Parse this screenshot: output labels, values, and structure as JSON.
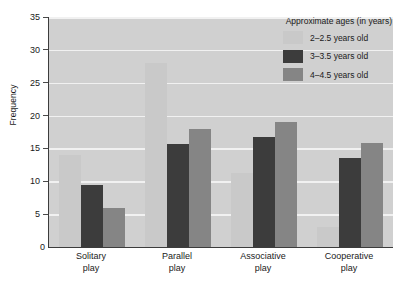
{
  "chart_data": {
    "type": "bar",
    "title": "",
    "xlabel": "",
    "ylabel": "Frequency",
    "ylim": [
      0,
      35
    ],
    "ytick_step": 5,
    "yticks": [
      0,
      5,
      10,
      15,
      20,
      25,
      30,
      35
    ],
    "grid": true,
    "legend_position": "top-right",
    "legend_title": "Approximate ages (in years)",
    "categories": [
      "Solitary play",
      "Parallel play",
      "Associative play",
      "Cooperative play"
    ],
    "category_lines": [
      [
        "Solitary",
        "play"
      ],
      [
        "Parallel",
        "play"
      ],
      [
        "Associative",
        "play"
      ],
      [
        "Cooperative",
        "play"
      ]
    ],
    "series": [
      {
        "name": "2–2.5 years old",
        "color": "#c9c9c9",
        "values": [
          14,
          28,
          11.3,
          3
        ]
      },
      {
        "name": "3–3.5 years old",
        "color": "#3c3c3c",
        "values": [
          9.5,
          15.7,
          16.7,
          13.6
        ]
      },
      {
        "name": "4–4.5 years old",
        "color": "#858585",
        "values": [
          6,
          18,
          19,
          15.8
        ]
      }
    ]
  },
  "colors": {
    "plot_background": "#d0d0d0",
    "gridline": "#f1f1f1",
    "axis": "#3c3c3c",
    "text": "#1a1a1a",
    "page_background": "#ffffff"
  }
}
